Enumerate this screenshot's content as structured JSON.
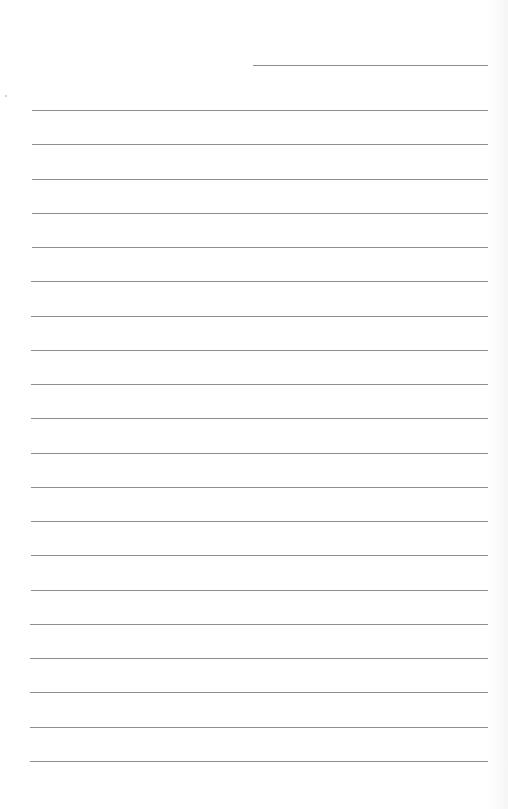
{
  "page": {
    "type": "lined-writing-sheet",
    "header_line": {
      "label": ""
    },
    "ruled_lines": [
      {
        "index": 1,
        "text": ""
      },
      {
        "index": 2,
        "text": ""
      },
      {
        "index": 3,
        "text": ""
      },
      {
        "index": 4,
        "text": ""
      },
      {
        "index": 5,
        "text": ""
      },
      {
        "index": 6,
        "text": ""
      },
      {
        "index": 7,
        "text": ""
      },
      {
        "index": 8,
        "text": ""
      },
      {
        "index": 9,
        "text": ""
      },
      {
        "index": 10,
        "text": ""
      },
      {
        "index": 11,
        "text": ""
      },
      {
        "index": 12,
        "text": ""
      },
      {
        "index": 13,
        "text": ""
      },
      {
        "index": 14,
        "text": ""
      },
      {
        "index": 15,
        "text": ""
      },
      {
        "index": 16,
        "text": ""
      },
      {
        "index": 17,
        "text": ""
      },
      {
        "index": 18,
        "text": ""
      },
      {
        "index": 19,
        "text": ""
      },
      {
        "index": 20,
        "text": ""
      }
    ],
    "colors": {
      "paper": "#ffffff",
      "rule": "#8e8e8e"
    }
  }
}
